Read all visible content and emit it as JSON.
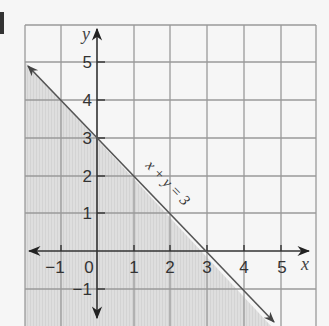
{
  "diagram": {
    "type": "inequality-graph",
    "axes": {
      "x_label": "x",
      "y_label": "y"
    },
    "x_tick_labels": [
      "−1",
      "0",
      "1",
      "2",
      "3",
      "4",
      "5"
    ],
    "y_tick_labels": [
      "5",
      "4",
      "3",
      "2",
      "1",
      "−1"
    ],
    "line_label": "x + y = 3",
    "line": {
      "equation": "x + y = 3",
      "from": [
        -2,
        5
      ],
      "to": [
        4.8,
        -1.8
      ]
    },
    "shaded_region": "x + y ≤ 3 (below the line)",
    "colors": {
      "background": "#f6f6f6",
      "grid": "#9a9a9a",
      "axis": "#333333",
      "shade": "#dcdcdc",
      "line": "#555555"
    }
  }
}
